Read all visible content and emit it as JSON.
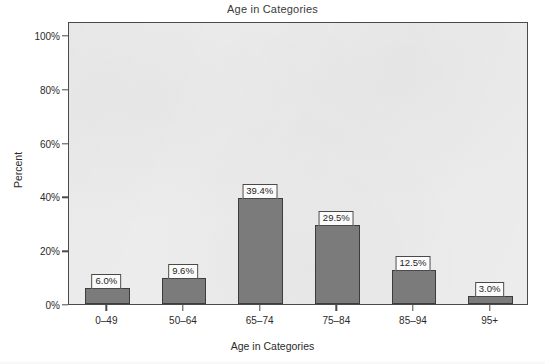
{
  "chart_data": {
    "type": "bar",
    "title": "Age in Categories",
    "xlabel": "Age in Categories",
    "ylabel": "Percent",
    "categories": [
      "0–49",
      "50–64",
      "65–74",
      "75–84",
      "85–94",
      "95+"
    ],
    "values": [
      6.0,
      9.6,
      39.4,
      29.5,
      12.5,
      3.0
    ],
    "data_labels": [
      "6.0%",
      "9.6%",
      "39.4%",
      "29.5%",
      "12.5%",
      "3.0%"
    ],
    "ylim": [
      0,
      100
    ],
    "ytick_values": [
      0,
      20,
      40,
      60,
      80,
      100
    ],
    "ytick_labels": [
      "0%",
      "20%",
      "40%",
      "60%",
      "80%",
      "100%"
    ],
    "grid": false,
    "legend": "none",
    "bar_color": "#7b7b7b",
    "bar_border_color": "#3c3c3c",
    "plot_background": "#ececec",
    "axis_color": "#4a4a4a",
    "label_box_background": "#fbfbfb"
  }
}
